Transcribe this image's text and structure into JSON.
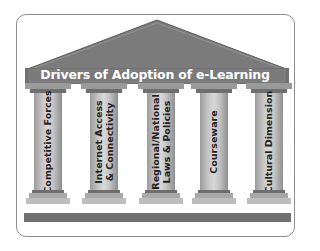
{
  "diagram": {
    "title": "Drivers of Adoption of e-Learning",
    "pillars": [
      {
        "label": "Competitive Forces"
      },
      {
        "label": "Internet Access\n& Connectivity"
      },
      {
        "label": "Regional/National\nLaws & Policies"
      },
      {
        "label": "Courseware"
      },
      {
        "label": "Cultural Dimension"
      }
    ],
    "colors": {
      "roof": "#7a7a7a",
      "roof_band": "#6a6a6a",
      "pillar_shaft": "#c6c6c6",
      "base": "#707070",
      "frame_border": "#8e8e8e"
    }
  }
}
